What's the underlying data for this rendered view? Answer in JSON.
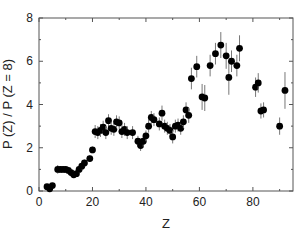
{
  "chart_data": {
    "type": "scatter",
    "title": "",
    "xlabel": "Z",
    "ylabel": "P (Z) / P (Z = 8)",
    "xlim": [
      0,
      95
    ],
    "ylim": [
      0,
      8
    ],
    "xticks": [
      0,
      20,
      40,
      60,
      80
    ],
    "yticks": [
      0,
      2,
      4,
      6,
      8
    ],
    "grid": false,
    "legend": null,
    "series": [
      {
        "name": "data",
        "marker": "filled-circle",
        "color": "#000000",
        "points": [
          {
            "x": 3,
            "y": 0.2,
            "err": 0.1
          },
          {
            "x": 4,
            "y": 0.1,
            "err": 0.1
          },
          {
            "x": 5,
            "y": 0.25,
            "err": 0.1
          },
          {
            "x": 7,
            "y": 1.0,
            "err": 0.2
          },
          {
            "x": 8,
            "y": 1.0,
            "err": 0.15
          },
          {
            "x": 9,
            "y": 1.0,
            "err": 0.15
          },
          {
            "x": 10,
            "y": 1.0,
            "err": 0.15
          },
          {
            "x": 11,
            "y": 0.95,
            "err": 0.15
          },
          {
            "x": 12,
            "y": 0.85,
            "err": 0.15
          },
          {
            "x": 13,
            "y": 0.75,
            "err": 0.15
          },
          {
            "x": 14,
            "y": 0.8,
            "err": 0.15
          },
          {
            "x": 15,
            "y": 1.0,
            "err": 0.15
          },
          {
            "x": 16,
            "y": 1.15,
            "err": 0.15
          },
          {
            "x": 17,
            "y": 1.3,
            "err": 0.15
          },
          {
            "x": 19,
            "y": 1.5,
            "err": 0.15
          },
          {
            "x": 20,
            "y": 1.9,
            "err": 0.15
          },
          {
            "x": 21,
            "y": 2.75,
            "err": 0.3
          },
          {
            "x": 22,
            "y": 2.7,
            "err": 0.3
          },
          {
            "x": 23,
            "y": 2.8,
            "err": 0.3
          },
          {
            "x": 24,
            "y": 2.95,
            "err": 0.3
          },
          {
            "x": 25,
            "y": 2.7,
            "err": 0.3
          },
          {
            "x": 26,
            "y": 3.25,
            "err": 0.3
          },
          {
            "x": 27,
            "y": 2.9,
            "err": 0.3
          },
          {
            "x": 28,
            "y": 2.85,
            "err": 0.3
          },
          {
            "x": 29,
            "y": 3.2,
            "err": 0.3
          },
          {
            "x": 30,
            "y": 3.15,
            "err": 0.3
          },
          {
            "x": 31,
            "y": 2.75,
            "err": 0.3
          },
          {
            "x": 32,
            "y": 2.85,
            "err": 0.3
          },
          {
            "x": 33,
            "y": 2.7,
            "err": 0.3
          },
          {
            "x": 35,
            "y": 2.7,
            "err": 0.3
          },
          {
            "x": 37,
            "y": 2.3,
            "err": 0.25
          },
          {
            "x": 38,
            "y": 2.1,
            "err": 0.25
          },
          {
            "x": 39,
            "y": 2.3,
            "err": 0.25
          },
          {
            "x": 40,
            "y": 2.55,
            "err": 0.25
          },
          {
            "x": 41,
            "y": 3.0,
            "err": 0.3
          },
          {
            "x": 42,
            "y": 3.4,
            "err": 0.3
          },
          {
            "x": 43,
            "y": 3.3,
            "err": 0.3
          },
          {
            "x": 45,
            "y": 3.1,
            "err": 0.3
          },
          {
            "x": 46,
            "y": 3.6,
            "err": 0.35
          },
          {
            "x": 47,
            "y": 3.0,
            "err": 0.3
          },
          {
            "x": 48,
            "y": 2.9,
            "err": 0.3
          },
          {
            "x": 49,
            "y": 2.8,
            "err": 0.3
          },
          {
            "x": 50,
            "y": 2.5,
            "err": 0.3
          },
          {
            "x": 51,
            "y": 3.0,
            "err": 0.3
          },
          {
            "x": 52,
            "y": 3.05,
            "err": 0.3
          },
          {
            "x": 53,
            "y": 2.9,
            "err": 0.3
          },
          {
            "x": 54,
            "y": 3.2,
            "err": 0.3
          },
          {
            "x": 55,
            "y": 3.75,
            "err": 0.35
          },
          {
            "x": 56,
            "y": 3.5,
            "err": 0.35
          },
          {
            "x": 57,
            "y": 5.2,
            "err": 0.5
          },
          {
            "x": 59,
            "y": 5.75,
            "err": 0.5
          },
          {
            "x": 61,
            "y": 4.35,
            "err": 0.6
          },
          {
            "x": 62,
            "y": 4.3,
            "err": 0.6
          },
          {
            "x": 64,
            "y": 5.8,
            "err": 0.5
          },
          {
            "x": 66,
            "y": 6.35,
            "err": 0.5
          },
          {
            "x": 68,
            "y": 6.75,
            "err": 0.6
          },
          {
            "x": 70,
            "y": 6.25,
            "err": 0.6
          },
          {
            "x": 71,
            "y": 5.25,
            "err": 0.8
          },
          {
            "x": 72,
            "y": 6.0,
            "err": 0.5
          },
          {
            "x": 74,
            "y": 5.8,
            "err": 0.5
          },
          {
            "x": 75,
            "y": 6.6,
            "err": 0.6
          },
          {
            "x": 81,
            "y": 4.8,
            "err": 0.45
          },
          {
            "x": 82,
            "y": 5.0,
            "err": 0.45
          },
          {
            "x": 83,
            "y": 3.7,
            "err": 0.35
          },
          {
            "x": 84,
            "y": 3.75,
            "err": 0.35
          },
          {
            "x": 90,
            "y": 3.0,
            "err": 0.4
          },
          {
            "x": 92,
            "y": 4.65,
            "err": 0.85
          }
        ]
      }
    ]
  }
}
